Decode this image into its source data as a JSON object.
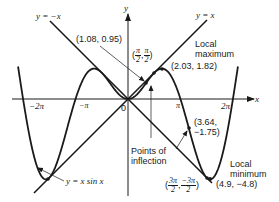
{
  "figure": {
    "function_label": "y = x sin x",
    "line_pos_label": "y = x",
    "line_neg_label": "y = −x",
    "axis_x_label": "x",
    "axis_y_label": "y",
    "origin_label": "0",
    "ticks": {
      "neg_two_pi": "−2π",
      "neg_pi": "−π",
      "pi": "π",
      "two_pi": "2π"
    },
    "annotations": {
      "point_1": "(1.08, 0.95)",
      "point_half_pi_open": "(",
      "point_half_pi_x_num": "π",
      "point_half_pi_x_den": "2",
      "point_half_pi_sep": ",",
      "point_half_pi_y_num": "π",
      "point_half_pi_y_den": "2",
      "point_half_pi_close": ")",
      "local_max_line1": "Local",
      "local_max_line2": "maximum",
      "local_max_point": "(2.03, 1.82)",
      "inflection_point_1": "(3.64,",
      "inflection_point_2": "−1.75)",
      "inflection_label_1": "Points of",
      "inflection_label_2": "inflection",
      "local_min_line1": "Local",
      "local_min_line2": "minimum",
      "local_min_point": "(4.9, −4.8)",
      "point_3half_open": "(",
      "point_3half_x_num": "3π",
      "point_3half_x_den": "2",
      "point_3half_sep": ",",
      "point_3half_y_num": "−3π",
      "point_3half_y_den": "2",
      "point_3half_close": ")"
    },
    "colors": {
      "ink": "#1a1a1a",
      "background": "#ffffff"
    }
  }
}
